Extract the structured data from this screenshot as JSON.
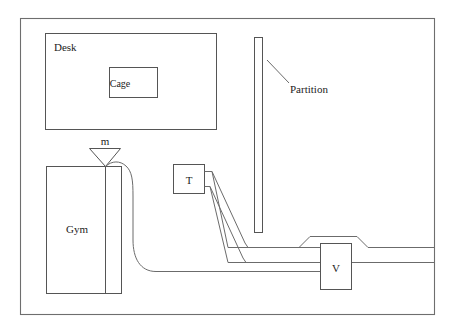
{
  "diagram": {
    "type": "schematic-line-diagram",
    "background_color": "#ffffff",
    "stroke_color": "#6b6b6b",
    "text_color": "#1c1c1c",
    "room": {
      "name": "room-outline",
      "x": 20,
      "y": 18,
      "width": 415,
      "height": 297
    },
    "labels": {
      "desk": "Desk",
      "cage": "Cage",
      "partition": "Partition",
      "gym": "Gym",
      "mass_flow": "m",
      "tank": "T",
      "valve": "V"
    },
    "elements": [
      {
        "name": "desk-box",
        "label": "Desk",
        "shape": "rectangle",
        "x": 45,
        "y": 33,
        "width": 172,
        "height": 97
      },
      {
        "name": "cage-box",
        "label": "Cage",
        "shape": "rectangle",
        "x": 109,
        "y": 67,
        "width": 49,
        "height": 31
      },
      {
        "name": "partition-box",
        "label": "Partition",
        "shape": "rectangle",
        "x": 254,
        "y": 37,
        "width": 8,
        "height": 196
      },
      {
        "name": "gym-box",
        "label": "Gym",
        "shape": "rectangle",
        "x": 46,
        "y": 166,
        "width": 76,
        "height": 128
      },
      {
        "name": "gym-column",
        "label": "",
        "shape": "vertical-line",
        "x": 105,
        "y": 166,
        "width": 0,
        "height": 128
      },
      {
        "name": "funnel",
        "label": "m",
        "shape": "triangle",
        "x": 89,
        "y": 148,
        "width": 32,
        "height": 18
      },
      {
        "name": "t-box",
        "label": "T",
        "shape": "rectangle",
        "x": 173,
        "y": 164,
        "width": 32,
        "height": 30
      },
      {
        "name": "v-box",
        "label": "V",
        "shape": "rectangle",
        "x": 320,
        "y": 243,
        "width": 32,
        "height": 47
      }
    ],
    "pipes": [
      {
        "name": "gym-to-valve-pipe",
        "description": "S-curve pipe from funnel outlet down to horizontal run into V box"
      },
      {
        "name": "t-upper-pipe",
        "description": "Upper pipe leaving T, sloping down-right then horizontal to right wall"
      },
      {
        "name": "t-lower-pipe",
        "description": "Lower pipe leaving T, sloping down-right then horizontal to right wall"
      },
      {
        "name": "valve-bypass-pipe",
        "description": "Pipe rising over the top of the V box and continuing right"
      }
    ],
    "leader_lines": [
      {
        "name": "partition-leader",
        "from_x": 268,
        "from_y": 60,
        "to_x": 288,
        "to_y": 82
      }
    ]
  }
}
